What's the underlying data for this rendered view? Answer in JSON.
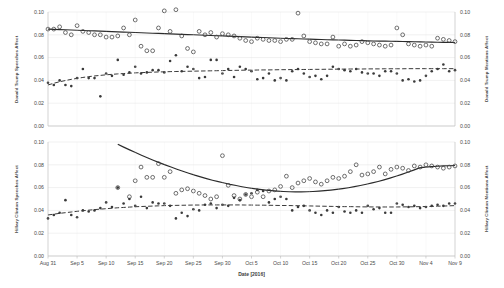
{
  "figure": {
    "background_color": "#ffffff",
    "width": 504,
    "height": 288
  },
  "xaxis": {
    "title": "Date [2016]",
    "tick_labels": [
      "Aug 31",
      "Sep 5",
      "Sep 10",
      "Sep 15",
      "Sep 20",
      "Sep 25",
      "Sep 30",
      "Oct 5",
      "Oct 10",
      "Oct 15",
      "Oct 20",
      "Oct 25",
      "Oct 30",
      "Nov 4",
      "Nov 9"
    ],
    "range_days": [
      0,
      70
    ]
  },
  "panels": {
    "top": {
      "left_axis_title": "Donald Trump Speeches Affect",
      "right_axis_title": "Donald Trump Mentions Affect",
      "y_ticks": [
        "0.00",
        "0.02",
        "0.04",
        "0.06",
        "0.08",
        "0.10"
      ],
      "ylim": [
        0.0,
        0.1
      ]
    },
    "bottom": {
      "left_axis_title": "Hillary Clinton Speeches Affect",
      "right_axis_title": "Hillary Clinton Mentions Affect",
      "y_ticks": [
        "0.00",
        "0.02",
        "0.04",
        "0.06",
        "0.08",
        "0.10"
      ],
      "ylim": [
        0.0,
        0.1
      ]
    }
  },
  "chart_data": [
    {
      "type": "scatter",
      "title": "Donald Trump Speeches Affect / Donald Trump Mentions Affect",
      "xlabel": "Date [2016]",
      "ylabel": "Donald Trump Speeches Affect",
      "y2label": "Donald Trump Mentions Affect",
      "ylim": [
        0.0,
        0.1
      ],
      "y2lim": [
        0.0,
        0.1
      ],
      "xlim_days": [
        0,
        70
      ],
      "xtick_days": [
        0,
        5,
        10,
        15,
        20,
        25,
        30,
        35,
        40,
        45,
        50,
        55,
        60,
        65,
        70
      ],
      "xtick_labels": [
        "Aug 31",
        "Sep 5",
        "Sep 10",
        "Sep 15",
        "Sep 20",
        "Sep 25",
        "Sep 30",
        "Oct 5",
        "Oct 10",
        "Oct 15",
        "Oct 20",
        "Oct 25",
        "Oct 30",
        "Nov 4",
        "Nov 9"
      ],
      "grid": true,
      "legend": "none",
      "series": [
        {
          "name": "Donald Trump Speeches Affect",
          "marker": "open-circle",
          "trendline": "solid",
          "x": [
            0,
            1,
            2,
            3,
            4,
            5,
            6,
            7,
            8,
            9,
            10,
            11,
            12,
            13,
            14,
            15,
            16,
            17,
            18,
            19,
            20,
            21,
            22,
            23,
            24,
            25,
            26,
            27,
            28,
            29,
            30,
            31,
            32,
            33,
            34,
            35,
            36,
            37,
            38,
            39,
            40,
            41,
            42,
            43,
            44,
            45,
            46,
            47,
            48,
            49,
            50,
            51,
            52,
            53,
            54,
            55,
            56,
            57,
            58,
            59,
            60,
            61,
            62,
            63,
            64,
            65,
            66,
            67,
            68,
            69,
            70
          ],
          "y": [
            0.085,
            0.085,
            0.087,
            0.082,
            0.08,
            0.088,
            0.083,
            0.082,
            0.08,
            0.08,
            0.078,
            0.078,
            0.079,
            0.086,
            0.08,
            0.093,
            0.07,
            0.066,
            0.066,
            0.086,
            0.101,
            0.083,
            0.102,
            0.079,
            0.068,
            0.065,
            0.083,
            0.08,
            0.082,
            0.078,
            0.081,
            0.08,
            0.079,
            0.077,
            0.075,
            0.074,
            0.077,
            0.076,
            0.075,
            0.075,
            0.074,
            0.076,
            0.076,
            0.099,
            0.079,
            0.074,
            0.073,
            0.072,
            0.072,
            0.078,
            0.07,
            0.072,
            0.07,
            0.071,
            0.074,
            0.073,
            0.072,
            0.071,
            0.07,
            0.071,
            0.086,
            0.08,
            0.072,
            0.071,
            0.07,
            0.071,
            0.07,
            0.077,
            0.076,
            0.075,
            0.074
          ],
          "trend_y": [
            0.085,
            0.0848,
            0.0846,
            0.0844,
            0.0842,
            0.084,
            0.0838,
            0.0836,
            0.0834,
            0.0832,
            0.083,
            0.0828,
            0.0826,
            0.0824,
            0.0822,
            0.082,
            0.0818,
            0.0816,
            0.0814,
            0.0812,
            0.081,
            0.0808,
            0.0806,
            0.0804,
            0.0802,
            0.08,
            0.0798,
            0.0796,
            0.0794,
            0.0792,
            0.079,
            0.0788,
            0.0786,
            0.0784,
            0.0782,
            0.078,
            0.0778,
            0.0776,
            0.0774,
            0.0772,
            0.077,
            0.0768,
            0.0767,
            0.0765,
            0.0763,
            0.0762,
            0.076,
            0.0759,
            0.0757,
            0.0756,
            0.0754,
            0.0753,
            0.0751,
            0.075,
            0.0749,
            0.0747,
            0.0746,
            0.0745,
            0.0744,
            0.0743,
            0.0742,
            0.0741,
            0.074,
            0.0739,
            0.0738,
            0.0737,
            0.0736,
            0.0735,
            0.0734,
            0.0733,
            0.0732
          ]
        },
        {
          "name": "Donald Trump Mentions Affect",
          "marker": "filled-circle",
          "trendline": "dashed",
          "x": [
            0,
            1,
            2,
            3,
            4,
            5,
            6,
            7,
            8,
            9,
            10,
            11,
            12,
            13,
            14,
            15,
            16,
            17,
            18,
            19,
            20,
            21,
            22,
            23,
            24,
            25,
            26,
            27,
            28,
            29,
            30,
            31,
            32,
            33,
            34,
            35,
            36,
            37,
            38,
            39,
            40,
            41,
            42,
            43,
            44,
            45,
            46,
            47,
            48,
            49,
            50,
            51,
            52,
            53,
            54,
            55,
            56,
            57,
            58,
            59,
            60,
            61,
            62,
            63,
            64,
            65,
            66,
            67,
            68,
            69,
            70
          ],
          "y": [
            0.038,
            0.036,
            0.04,
            0.036,
            0.035,
            0.042,
            0.05,
            0.042,
            0.042,
            0.026,
            0.046,
            0.044,
            0.058,
            0.045,
            0.047,
            0.052,
            0.046,
            0.047,
            0.049,
            0.049,
            0.047,
            0.057,
            0.062,
            0.048,
            0.052,
            0.05,
            0.042,
            0.043,
            0.058,
            0.058,
            0.046,
            0.05,
            0.043,
            0.052,
            0.05,
            0.048,
            0.041,
            0.042,
            0.046,
            0.04,
            0.042,
            0.04,
            0.048,
            0.05,
            0.046,
            0.043,
            0.044,
            0.041,
            0.044,
            0.052,
            0.05,
            0.049,
            0.048,
            0.05,
            0.047,
            0.046,
            0.046,
            0.044,
            0.048,
            0.048,
            0.046,
            0.04,
            0.041,
            0.039,
            0.04,
            0.044,
            0.048,
            0.05,
            0.054,
            0.048,
            0.049
          ],
          "trend_y": [
            0.036,
            0.0375,
            0.0388,
            0.0399,
            0.0409,
            0.0418,
            0.0426,
            0.0433,
            0.0439,
            0.0444,
            0.0449,
            0.0453,
            0.0457,
            0.046,
            0.0463,
            0.0466,
            0.0468,
            0.047,
            0.0472,
            0.0474,
            0.0475,
            0.0477,
            0.0478,
            0.0479,
            0.048,
            0.0481,
            0.0482,
            0.0483,
            0.0484,
            0.0485,
            0.0486,
            0.0487,
            0.0488,
            0.0489,
            0.049,
            0.049,
            0.0491,
            0.0492,
            0.0492,
            0.0493,
            0.0494,
            0.0494,
            0.0495,
            0.0495,
            0.0496,
            0.0496,
            0.0497,
            0.0497,
            0.0498,
            0.0498,
            0.0499,
            0.0499,
            0.05,
            0.05,
            0.05,
            0.0501,
            0.0501,
            0.0501,
            0.0502,
            0.0502,
            0.0502,
            0.0502,
            0.0503,
            0.0503,
            0.0503,
            0.0503,
            0.0503,
            0.0503,
            0.0503,
            0.0503,
            0.0503
          ]
        }
      ]
    },
    {
      "type": "scatter",
      "title": "Hillary Clinton Speeches Affect / Hillary Clinton Mentions Affect",
      "xlabel": "Date [2016]",
      "ylabel": "Hillary Clinton Speeches Affect",
      "y2label": "Hillary Clinton Mentions Affect",
      "ylim": [
        0.0,
        0.1
      ],
      "y2lim": [
        0.0,
        0.1
      ],
      "xlim_days": [
        0,
        70
      ],
      "xtick_days": [
        0,
        5,
        10,
        15,
        20,
        25,
        30,
        35,
        40,
        45,
        50,
        55,
        60,
        65,
        70
      ],
      "xtick_labels": [
        "Aug 31",
        "Sep 5",
        "Sep 10",
        "Sep 15",
        "Sep 20",
        "Sep 25",
        "Sep 30",
        "Oct 5",
        "Oct 10",
        "Oct 15",
        "Oct 20",
        "Oct 25",
        "Oct 30",
        "Nov 4",
        "Nov 9"
      ],
      "grid": true,
      "legend": "none",
      "series": [
        {
          "name": "Hillary Clinton Speeches Affect",
          "marker": "open-circle",
          "trendline": "solid",
          "x": [
            12,
            14,
            15,
            16,
            17,
            18,
            19,
            20,
            21,
            22,
            23,
            24,
            25,
            26,
            27,
            28,
            29,
            30,
            31,
            32,
            33,
            34,
            35,
            36,
            37,
            38,
            39,
            40,
            41,
            42,
            43,
            44,
            45,
            46,
            47,
            48,
            49,
            50,
            51,
            52,
            53,
            54,
            55,
            56,
            57,
            58,
            59,
            60,
            61,
            62,
            63,
            64,
            65,
            66,
            67,
            68,
            69,
            70
          ],
          "y": [
            0.06,
            0.052,
            0.066,
            0.078,
            0.069,
            0.069,
            0.081,
            0.069,
            0.074,
            0.055,
            0.058,
            0.059,
            0.057,
            0.055,
            0.053,
            0.05,
            0.052,
            0.088,
            0.062,
            0.053,
            0.05,
            0.054,
            0.052,
            0.056,
            0.052,
            0.057,
            0.058,
            0.061,
            0.07,
            0.06,
            0.064,
            0.066,
            0.068,
            0.065,
            0.063,
            0.066,
            0.069,
            0.068,
            0.07,
            0.074,
            0.08,
            0.071,
            0.072,
            0.074,
            0.078,
            0.072,
            0.076,
            0.078,
            0.077,
            0.075,
            0.079,
            0.078,
            0.08,
            0.079,
            0.078,
            0.077,
            0.078,
            0.079
          ],
          "trend_y": [
            0.098,
            0.0955,
            0.0931,
            0.0907,
            0.0884,
            0.0862,
            0.084,
            0.0819,
            0.0799,
            0.078,
            0.0761,
            0.0743,
            0.0726,
            0.0709,
            0.0694,
            0.0679,
            0.0665,
            0.0652,
            0.064,
            0.0628,
            0.0618,
            0.0608,
            0.0599,
            0.0591,
            0.0584,
            0.0578,
            0.0573,
            0.0569,
            0.0566,
            0.0564,
            0.0563,
            0.0563,
            0.0564,
            0.0566,
            0.0569,
            0.0573,
            0.0578,
            0.0584,
            0.0591,
            0.0599,
            0.0608,
            0.0618,
            0.0629,
            0.0641,
            0.0654,
            0.0668,
            0.0683,
            0.0699,
            0.0716,
            0.0734,
            0.0753,
            0.0773,
            0.078,
            0.0784,
            0.0787,
            0.079,
            0.0792,
            0.0794
          ]
        },
        {
          "name": "Hillary Clinton Mentions Affect",
          "marker": "filled-circle",
          "trendline": "dashed",
          "x": [
            0,
            1,
            2,
            3,
            4,
            5,
            6,
            7,
            8,
            9,
            10,
            11,
            12,
            13,
            14,
            15,
            16,
            17,
            18,
            19,
            20,
            21,
            22,
            23,
            24,
            25,
            26,
            27,
            28,
            29,
            30,
            31,
            32,
            33,
            34,
            35,
            36,
            37,
            38,
            39,
            40,
            41,
            42,
            43,
            44,
            45,
            46,
            47,
            48,
            49,
            50,
            51,
            52,
            53,
            54,
            55,
            56,
            57,
            58,
            59,
            60,
            61,
            62,
            63,
            64,
            65,
            66,
            67,
            68,
            69,
            70
          ],
          "y": [
            0.033,
            0.036,
            0.038,
            0.049,
            0.036,
            0.034,
            0.04,
            0.039,
            0.04,
            0.042,
            0.047,
            0.043,
            0.06,
            0.046,
            0.05,
            0.044,
            0.052,
            0.042,
            0.047,
            0.046,
            0.046,
            0.044,
            0.033,
            0.038,
            0.035,
            0.041,
            0.04,
            0.045,
            0.046,
            0.042,
            0.045,
            0.044,
            0.051,
            0.049,
            0.054,
            0.055,
            0.058,
            0.057,
            0.047,
            0.05,
            0.052,
            0.05,
            0.04,
            0.043,
            0.044,
            0.04,
            0.038,
            0.036,
            0.04,
            0.038,
            0.043,
            0.039,
            0.038,
            0.04,
            0.038,
            0.044,
            0.041,
            0.042,
            0.038,
            0.038,
            0.046,
            0.045,
            0.043,
            0.044,
            0.042,
            0.043,
            0.044,
            0.045,
            0.044,
            0.046,
            0.046
          ],
          "trend_y": [
            0.036,
            0.0367,
            0.0374,
            0.038,
            0.0386,
            0.0392,
            0.0397,
            0.0402,
            0.0407,
            0.0411,
            0.0415,
            0.0419,
            0.0423,
            0.0426,
            0.0429,
            0.0432,
            0.0434,
            0.0436,
            0.0438,
            0.044,
            0.0442,
            0.0443,
            0.0444,
            0.0445,
            0.0446,
            0.0447,
            0.0447,
            0.0448,
            0.0448,
            0.0448,
            0.0448,
            0.0448,
            0.0448,
            0.0448,
            0.0447,
            0.0447,
            0.0446,
            0.0446,
            0.0445,
            0.0444,
            0.0443,
            0.0443,
            0.0442,
            0.0441,
            0.044,
            0.0439,
            0.0438,
            0.0437,
            0.0436,
            0.0435,
            0.0434,
            0.0433,
            0.0433,
            0.0432,
            0.0431,
            0.0431,
            0.043,
            0.043,
            0.043,
            0.043,
            0.043,
            0.0431,
            0.0431,
            0.0432,
            0.0433,
            0.0434,
            0.0435,
            0.0437,
            0.0438,
            0.044,
            0.0442
          ]
        }
      ]
    }
  ]
}
